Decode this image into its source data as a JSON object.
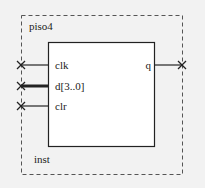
{
  "symbol": {
    "entity_name": "piso4",
    "instance_name": "inst",
    "inputs": [
      {
        "name": "clk",
        "bus": false
      },
      {
        "name": "d[3..0]",
        "bus": true
      },
      {
        "name": "clr",
        "bus": false
      }
    ],
    "outputs": [
      {
        "name": "q",
        "bus": false
      }
    ]
  },
  "colors": {
    "background": "#f2f2f2",
    "box_fill": "#ffffff",
    "line": "#222222",
    "dashed": "#555555"
  }
}
